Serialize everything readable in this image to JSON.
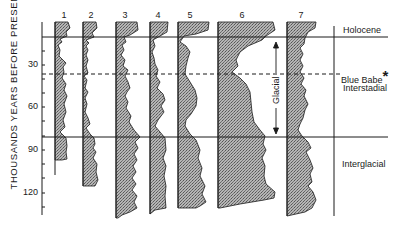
{
  "figure": {
    "y_axis_label": "THOUSANDS YEARS BEFORE PRESENT",
    "y_ticks": [
      {
        "label": "30",
        "value": 30
      },
      {
        "label": "60",
        "value": 60
      },
      {
        "label": "90",
        "value": 90
      },
      {
        "label": "120",
        "value": 120
      }
    ],
    "columns": [
      {
        "label": "1"
      },
      {
        "label": "2"
      },
      {
        "label": "3"
      },
      {
        "label": "4"
      },
      {
        "label": "5"
      },
      {
        "label": "6"
      },
      {
        "label": "7"
      }
    ],
    "right_labels": {
      "holocene": "Holocene",
      "blue_babe": "Blue Babe",
      "blue_babe_marker": "*",
      "interstadial": "Interstadial",
      "interglacial": "Interglacial"
    },
    "glacial_label": "Glacial",
    "colors": {
      "ink": "#1a1a1a",
      "fill": "#9a9a9a",
      "background": "#ffffff"
    }
  }
}
